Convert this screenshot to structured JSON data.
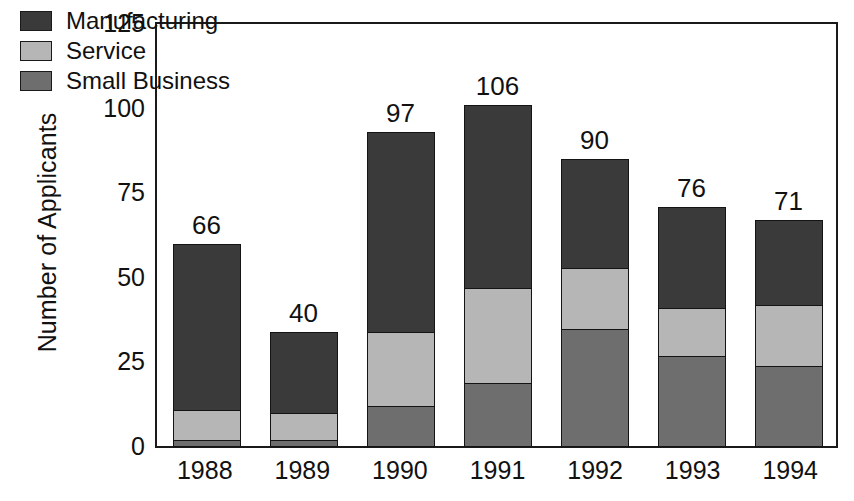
{
  "chart_data": {
    "type": "bar",
    "subtype": "stacked-bar",
    "title": "",
    "xlabel": "",
    "ylabel": "Number of Applicants",
    "ylim": [
      0,
      125
    ],
    "yticks": [
      0,
      25,
      50,
      75,
      100,
      125
    ],
    "ytick_labels": [
      "0",
      "25",
      "50",
      "75",
      "100",
      "125"
    ],
    "grid": false,
    "legend_position": "top-left-inside",
    "categories": [
      "1988",
      "1989",
      "1990",
      "1991",
      "1992",
      "1993",
      "1994"
    ],
    "series": [
      {
        "name": "Manufacturing",
        "color": "#3a3a3a",
        "values": [
          49,
          24,
          59,
          54,
          32,
          30,
          25
        ]
      },
      {
        "name": "Service",
        "color": "#b6b6b6",
        "values": [
          9,
          8,
          22,
          28,
          18,
          14,
          18
        ]
      },
      {
        "name": "Small Business",
        "color": "#6e6e6e",
        "values": [
          2,
          2,
          12,
          19,
          35,
          27,
          24
        ]
      }
    ],
    "totals": [
      66,
      40,
      97,
      106,
      90,
      76,
      71
    ],
    "total_labels": [
      "66",
      "40",
      "97",
      "106",
      "90",
      "76",
      "71"
    ],
    "annotations": "Total applicant count printed above each stacked bar."
  },
  "legend": {
    "items": [
      {
        "label": "Manufacturing",
        "color": "#3a3a3a"
      },
      {
        "label": "Service",
        "color": "#b6b6b6"
      },
      {
        "label": "Small Business",
        "color": "#6e6e6e"
      }
    ]
  },
  "axes": {
    "y_title": "Number of Applicants",
    "y_tick_labels": [
      "125",
      "100",
      "75",
      "50",
      "25",
      "0"
    ],
    "x_tick_labels": [
      "1988",
      "1989",
      "1990",
      "1991",
      "1992",
      "1993",
      "1994"
    ]
  },
  "colors": {
    "manufacturing": "#3a3a3a",
    "service": "#b6b6b6",
    "small_business": "#6e6e6e",
    "outline": "#141414",
    "text": "#111111",
    "background": "#ffffff"
  }
}
